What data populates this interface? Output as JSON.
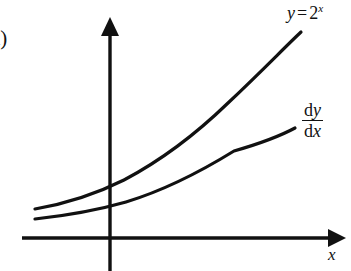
{
  "figure": {
    "part_label": "a)",
    "background_color": "#ffffff",
    "ink_color": "#111111"
  },
  "axes": {
    "x_label": "x",
    "y_label": "",
    "x_axis_color": "#111111",
    "y_axis_color": "#111111",
    "origin": {
      "x": 110,
      "y": 238
    },
    "x_axis_from": {
      "x": 22,
      "y": 238
    },
    "x_axis_to": {
      "x": 341,
      "y": 238
    },
    "y_axis_from": {
      "x": 110,
      "y": 271
    },
    "y_axis_to": {
      "x": 110,
      "y": 22
    },
    "arrowheads": [
      "x-positive",
      "y-positive"
    ],
    "ticks": [],
    "tick_labels": []
  },
  "labels": {
    "curve_main": {
      "y": "y",
      "equals": "=",
      "base": "2",
      "exponent": "x",
      "full_text": "y = 2^x"
    },
    "curve_derivative": {
      "numerator_d": "d",
      "numerator_var": "y",
      "denominator_d": "d",
      "denominator_var": "x",
      "full_text": "dy/dx"
    }
  },
  "chart_data": {
    "type": "line",
    "title": "",
    "subtitle": "",
    "xlabel": "x",
    "ylabel": "",
    "grid": false,
    "legend": "inline-curve-labels",
    "xlim": [
      -2.2,
      3.3
    ],
    "ylim": [
      0,
      9.2
    ],
    "annotations": [
      "a)"
    ],
    "series": [
      {
        "name": "y = 2^x",
        "label": "y = 2^x",
        "color": "#111111",
        "linewidth": 3.2,
        "path": "M 35 209 C 70 203, 96 194, 124 180 C 160 161, 196 134, 228 103 C 262 71, 285 47, 301 32",
        "x": [
          -2.2,
          -1.6,
          -1.0,
          -0.4,
          0.0,
          0.6,
          1.2,
          1.8,
          2.4,
          3.0
        ],
        "values": [
          0.22,
          0.33,
          0.5,
          0.76,
          1.0,
          1.52,
          2.3,
          3.48,
          5.28,
          8.0
        ]
      },
      {
        "name": "dy/dx",
        "label": "dy/dx",
        "color": "#111111",
        "linewidth": 3.2,
        "path": "M 35 219 C 72 215, 98 210, 126 202 C 162 191, 200 172, 234 151 C 262 143, 282 135, 295 128",
        "x": [
          -2.2,
          -1.6,
          -1.0,
          -0.4,
          0.0,
          0.6,
          1.2,
          1.8,
          2.4,
          3.0
        ],
        "values": [
          0.15,
          0.23,
          0.35,
          0.53,
          0.69,
          1.05,
          1.59,
          2.41,
          3.66,
          5.55
        ]
      }
    ]
  }
}
